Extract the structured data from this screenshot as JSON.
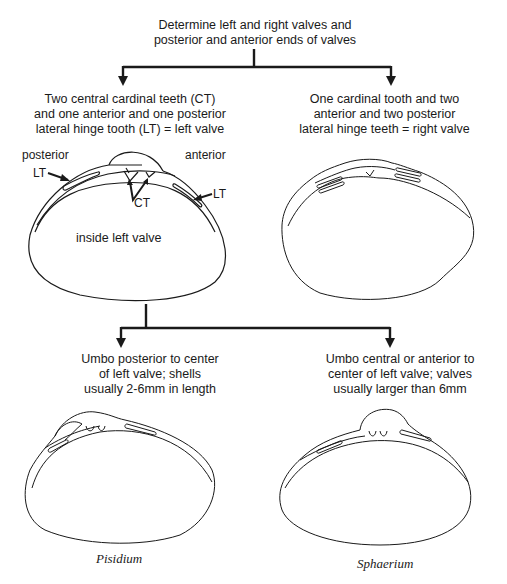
{
  "diagram": {
    "type": "dichotomous-key",
    "root": {
      "text": "Determine left and right valves and\nposterior and anterior ends of valves"
    },
    "level1": {
      "left": {
        "text": "Two central cardinal teeth (CT)\nand one anterior and one posterior\nlateral hinge tooth (LT) = left valve",
        "labels": {
          "posterior": "posterior",
          "anterior": "anterior",
          "lt_left": "LT",
          "lt_right": "LT",
          "ct": "CT",
          "inside": "inside left valve"
        }
      },
      "right": {
        "text": "One cardinal tooth and two\nanterior and two posterior\nlateral hinge teeth = right valve"
      }
    },
    "level2": {
      "left": {
        "text": "Umbo posterior to center\nof left valve; shells\nusually 2-6mm in length",
        "species": "Pisidium"
      },
      "right": {
        "text": "Umbo central or anterior to\ncenter of left valve; valves\nusually larger than 6mm",
        "species": "Sphaerium"
      }
    },
    "colors": {
      "line": "#1a1a1a",
      "background": "#ffffff"
    }
  }
}
